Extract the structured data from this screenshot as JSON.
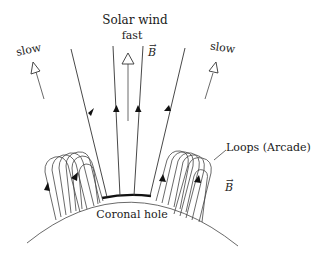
{
  "diagram": {
    "title": "Solar wind",
    "labels": {
      "solar_wind": "Solar wind",
      "fast": "fast",
      "slow_left": "slow",
      "slow_right": "slow",
      "b_field_top": "B",
      "b_field_right": "B",
      "loops": "Loops (Arcade)",
      "coronal_hole": "Coronal hole"
    },
    "elements": {
      "open_field_lines": 4,
      "loop_arcades": 2,
      "wind_arrows": [
        "slow (left)",
        "fast (center)",
        "slow (right)"
      ]
    },
    "colors": {
      "line": "#333333",
      "background": "#ffffff",
      "coronal_hole": "#111111"
    }
  }
}
